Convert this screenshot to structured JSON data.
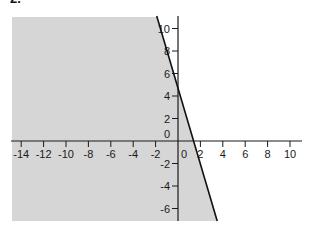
{
  "problem": {
    "number": "2."
  },
  "colors": {
    "shade": "#d6d6d6",
    "axis": "#1a1a1a",
    "line": "#111111",
    "background": "#ffffff"
  },
  "chart_data": {
    "type": "line",
    "title": "",
    "xlabel": "",
    "ylabel": "",
    "xlim": [
      -15,
      11
    ],
    "ylim": [
      -7.2,
      11
    ],
    "grid": false,
    "legend": null,
    "x_ticks": [
      -14,
      -12,
      -10,
      -8,
      -6,
      -4,
      -2,
      0,
      2,
      4,
      6,
      8,
      10
    ],
    "y_ticks": [
      10,
      8,
      6,
      4,
      2,
      0,
      -2,
      -4,
      -6
    ],
    "series": [
      {
        "name": "boundary line",
        "equation": "y = -10/3 x + 5",
        "slope": -3.33,
        "intercept": 5,
        "x": [
          -1.9,
          3.5
        ],
        "y": [
          11.3,
          -6.7
        ]
      }
    ],
    "shaded_region": {
      "description": "half-plane below/left of the boundary line",
      "inequality": "10x + 3y <= 15",
      "color": "#d6d6d6"
    },
    "annotations": [
      "2."
    ]
  }
}
